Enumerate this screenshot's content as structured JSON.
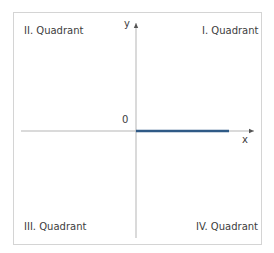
{
  "diagram": {
    "quadrants": {
      "q1": "I. Quadrant",
      "q2": "II. Quadrant",
      "q3": "III. Quadrant",
      "q4": "IV. Quadrant"
    },
    "axes": {
      "x_label": "x",
      "y_label": "y",
      "origin_label": "0"
    },
    "colors": {
      "axis": "#b0b0b0",
      "frame": "#d4d4d4",
      "ray": "#2f5a86",
      "text": "#3d3d3d"
    },
    "ray": {
      "description": "positive x-axis segment from origin",
      "from": [
        0,
        0
      ],
      "to": "positive x"
    }
  }
}
